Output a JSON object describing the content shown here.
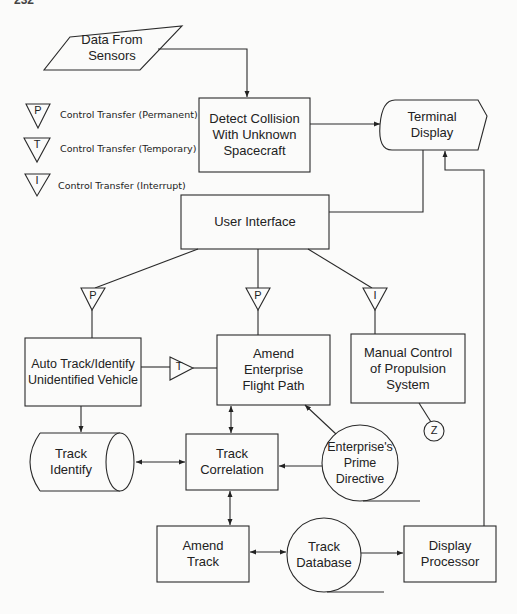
{
  "page_number": "232",
  "legend": [
    {
      "symbol": "P",
      "label": "Control Transfer (Permanent)"
    },
    {
      "symbol": "T",
      "label": "Control Transfer (Temporary)"
    },
    {
      "symbol": "I",
      "label": "Control Transfer (Interrupt)"
    }
  ],
  "nodes": {
    "data_from_sensors": "Data From\nSensors",
    "detect_collision": "Detect Collision\nWith Unknown\nSpacecraft",
    "terminal_display": "Terminal\nDisplay",
    "user_interface": "User Interface",
    "auto_track": "Auto Track/Identify\nUnidentified Vehicle",
    "amend_flight_path": "Amend\nEnterprise\nFlight Path",
    "manual_control": "Manual Control\nof Propulsion\nSystem",
    "track_identify": "Track\nIdentify",
    "track_correlation": "Track\nCorrelation",
    "prime_directive": "Enterprise's\nPrime\nDirective",
    "amend_track": "Amend\nTrack",
    "track_database": "Track\nDatabase",
    "display_processor": "Display\nProcessor"
  },
  "transfers": {
    "to_auto_track": "P",
    "to_amend_flight_path": "P",
    "to_manual_control": "I",
    "auto_to_amend": "T",
    "offpage_connector": "Z"
  }
}
